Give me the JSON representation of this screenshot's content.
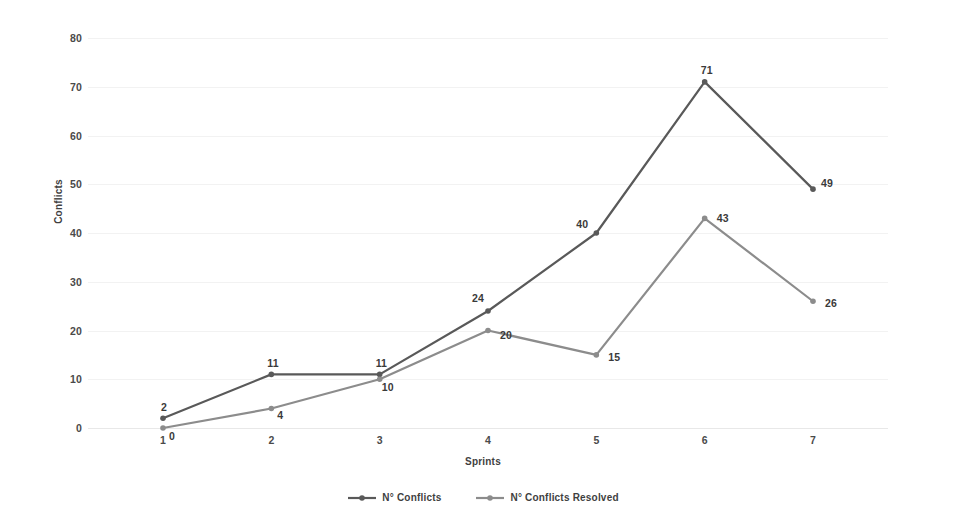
{
  "chart_data": {
    "type": "line",
    "title": "",
    "xlabel": "Sprints",
    "ylabel": "Conflicts",
    "categories": [
      "1",
      "2",
      "3",
      "4",
      "5",
      "6",
      "7"
    ],
    "x": [
      1,
      2,
      3,
      4,
      5,
      6,
      7
    ],
    "ylim": [
      0,
      80
    ],
    "y_ticks": [
      "0",
      "10",
      "20",
      "30",
      "40",
      "50",
      "60",
      "70",
      "80"
    ],
    "y_tick_values": [
      0,
      10,
      20,
      30,
      40,
      50,
      60,
      70,
      80
    ],
    "grid": true,
    "legend_position": "bottom",
    "series": [
      {
        "name": "N° Conflicts",
        "color": "#595959",
        "marker": "circle",
        "values": [
          2,
          11,
          11,
          24,
          40,
          71,
          49
        ],
        "labels": [
          "2",
          "11",
          "11",
          "24",
          "40",
          "71",
          "49"
        ]
      },
      {
        "name": "N° Conflicts Resolved",
        "color": "#8c8c8c",
        "marker": "circle",
        "values": [
          0,
          4,
          10,
          20,
          15,
          43,
          26
        ],
        "labels": [
          "0",
          "4",
          "10",
          "20",
          "15",
          "43",
          "26"
        ]
      }
    ]
  },
  "colors": {
    "background": "#ffffff",
    "gridline": "#f2f2f2",
    "text": "#3f3f3f",
    "series_conflicts": "#595959",
    "series_resolved": "#8c8c8c"
  }
}
